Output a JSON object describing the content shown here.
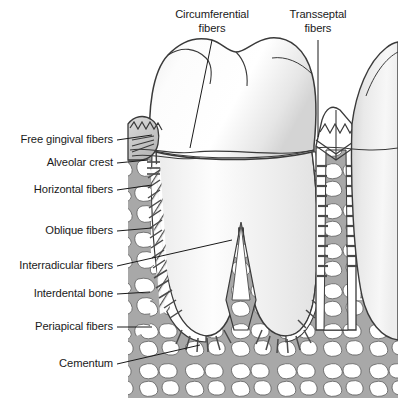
{
  "figure": {
    "width": 398,
    "height": 398,
    "background": "#ffffff"
  },
  "colors": {
    "outline": "#3a3a3a",
    "bone_fill": "#a8a8a8",
    "bone_marrow": "#ffffff",
    "tooth_fill": "#fbfbfb",
    "tooth_shadow": "#d8d8d8",
    "gingiva_fill": "#c9c9c9",
    "pdl_fill": "#ffffff",
    "fiber_stroke": "#4a4a4a",
    "leader_line": "#1a1a1a",
    "label_text": "#1a1a1a"
  },
  "labels": {
    "top": [
      {
        "id": "circumferential-fibers",
        "line1": "Circumferential",
        "line2": "fibers",
        "text_x": 212,
        "text_y": 8,
        "leader": {
          "x1": 212,
          "y1": 40,
          "x2": 190,
          "y2": 148
        }
      },
      {
        "id": "transseptal-fibers",
        "line1": "Transseptal",
        "line2": "fibers",
        "text_x": 318,
        "text_y": 8,
        "leader": {
          "x1": 318,
          "y1": 40,
          "x2": 318,
          "y2": 137
        }
      }
    ],
    "left": [
      {
        "id": "free-gingival-fibers",
        "text": "Free gingival fibers",
        "text_right": 113,
        "text_y": 140,
        "leader": {
          "x1": 117,
          "y1": 140,
          "x2": 152,
          "y2": 135
        }
      },
      {
        "id": "alveolar-crest",
        "text": "Alveolar crest",
        "text_right": 113,
        "text_y": 163,
        "leader": {
          "x1": 117,
          "y1": 163,
          "x2": 148,
          "y2": 160
        }
      },
      {
        "id": "horizontal-fibers",
        "text": "Horizontal fibers",
        "text_right": 113,
        "text_y": 190,
        "leader": {
          "x1": 117,
          "y1": 190,
          "x2": 152,
          "y2": 185
        }
      },
      {
        "id": "oblique-fibers",
        "text": "Oblique fibers",
        "text_right": 113,
        "text_y": 231,
        "leader": {
          "x1": 117,
          "y1": 231,
          "x2": 152,
          "y2": 228
        }
      },
      {
        "id": "interradicular-fibers",
        "text": "Interradicular fibers",
        "text_right": 113,
        "text_y": 266,
        "leader": {
          "x1": 117,
          "y1": 266,
          "x2": 232,
          "y2": 240
        }
      },
      {
        "id": "interdental-bone",
        "text": "Interdental bone",
        "text_right": 113,
        "text_y": 294,
        "leader": {
          "x1": 117,
          "y1": 294,
          "x2": 150,
          "y2": 292
        }
      },
      {
        "id": "periapical-fibers",
        "text": "Periapical fibers",
        "text_right": 113,
        "text_y": 327,
        "leader": {
          "x1": 117,
          "y1": 327,
          "x2": 152,
          "y2": 327
        }
      },
      {
        "id": "cementum",
        "text": "Cementum",
        "text_right": 113,
        "text_y": 364,
        "leader": {
          "x1": 117,
          "y1": 364,
          "x2": 200,
          "y2": 345
        }
      }
    ]
  },
  "structures": [
    {
      "id": "tooth-crown",
      "name": "Molar crown"
    },
    {
      "id": "tooth-root-mesial",
      "name": "Mesial root"
    },
    {
      "id": "tooth-root-distal",
      "name": "Distal root"
    },
    {
      "id": "adjacent-tooth",
      "name": "Adjacent tooth"
    },
    {
      "id": "alveolar-bone",
      "name": "Alveolar / trabecular bone"
    },
    {
      "id": "interdental-septum",
      "name": "Interdental bone septum"
    },
    {
      "id": "gingiva",
      "name": "Gingiva"
    },
    {
      "id": "periodontal-ligament",
      "name": "Periodontal ligament space"
    }
  ]
}
